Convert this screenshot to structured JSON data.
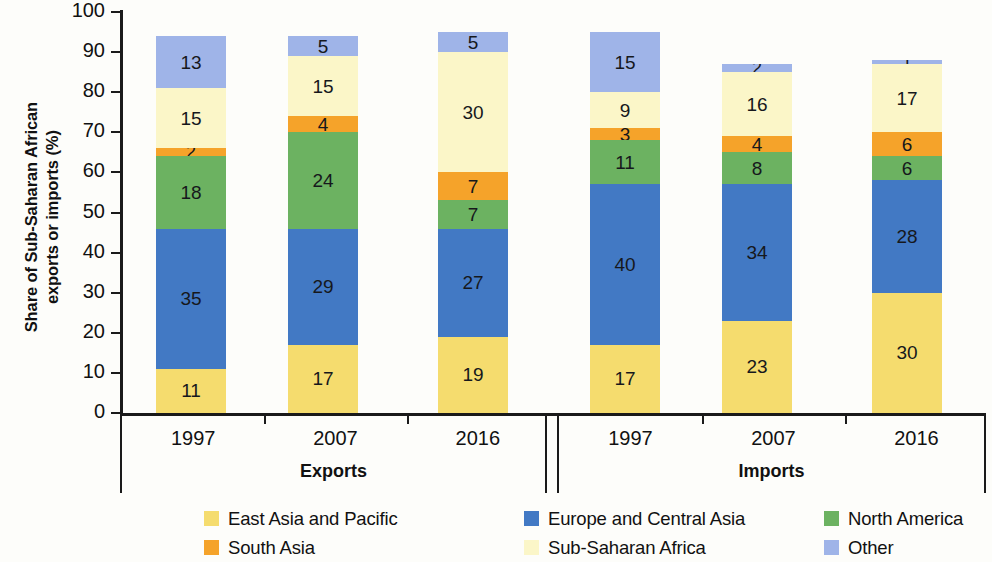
{
  "chart_data": {
    "type": "bar",
    "stacked": true,
    "normalized": true,
    "title": "",
    "xlabel": "",
    "ylabel": "Share of Sub-Saharan African exports or imports (%)",
    "ylim": [
      0,
      100
    ],
    "yticks": [
      0,
      10,
      20,
      30,
      40,
      50,
      60,
      70,
      80,
      90,
      100
    ],
    "grid": false,
    "legend_position": "bottom",
    "groups": [
      {
        "label": "Exports",
        "categories": [
          "1997",
          "2007",
          "2016"
        ]
      },
      {
        "label": "Imports",
        "categories": [
          "1997",
          "2007",
          "2016"
        ]
      }
    ],
    "categories": [
      "Exports 1997",
      "Exports 2007",
      "Exports 2016",
      "Imports 1997",
      "Imports 2007",
      "Imports 2016"
    ],
    "series": [
      {
        "name": "East Asia and Pacific",
        "color": "#f5dc6e",
        "values": [
          11,
          17,
          19,
          17,
          23,
          30
        ]
      },
      {
        "name": "Europe and Central Asia",
        "color": "#4279c4",
        "values": [
          35,
          29,
          27,
          40,
          34,
          28
        ]
      },
      {
        "name": "North America",
        "color": "#6cb261",
        "values": [
          18,
          24,
          7,
          11,
          8,
          6
        ]
      },
      {
        "name": "South Asia",
        "color": "#f5a32a",
        "values": [
          2,
          4,
          7,
          3,
          4,
          6
        ]
      },
      {
        "name": "Sub-Saharan Africa",
        "color": "#fbf6c8",
        "values": [
          15,
          15,
          30,
          9,
          16,
          17
        ]
      },
      {
        "name": "Other",
        "color": "#9fb4e8",
        "values": [
          13,
          5,
          5,
          15,
          2,
          1
        ]
      }
    ]
  },
  "axis": {
    "y_title_line1": "Share of Sub-Saharan African",
    "y_title_line2": "exports or imports (%)"
  }
}
